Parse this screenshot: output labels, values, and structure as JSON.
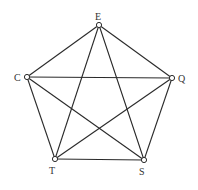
{
  "diagram": {
    "type": "complete-graph",
    "nodes": [
      {
        "id": "E",
        "label": "E",
        "x": 99,
        "y": 25,
        "label_x": 95,
        "label_y": 20
      },
      {
        "id": "C",
        "label": "C",
        "x": 27,
        "y": 77,
        "label_x": 14,
        "label_y": 81
      },
      {
        "id": "Q",
        "label": "Q",
        "x": 172,
        "y": 78,
        "label_x": 178,
        "label_y": 82
      },
      {
        "id": "T",
        "label": "T",
        "x": 55,
        "y": 159,
        "label_x": 49,
        "label_y": 174
      },
      {
        "id": "S",
        "label": "S",
        "x": 144,
        "y": 160,
        "label_x": 139,
        "label_y": 175
      }
    ],
    "edges": [
      [
        "E",
        "C"
      ],
      [
        "E",
        "Q"
      ],
      [
        "E",
        "T"
      ],
      [
        "E",
        "S"
      ],
      [
        "C",
        "Q"
      ],
      [
        "C",
        "T"
      ],
      [
        "C",
        "S"
      ],
      [
        "Q",
        "T"
      ],
      [
        "Q",
        "S"
      ],
      [
        "T",
        "S"
      ]
    ],
    "colors": {
      "edge": "#2a2a2a",
      "node_fill": "#ffffff",
      "node_stroke": "#2a2a2a",
      "label": "#333333",
      "background": "#ffffff"
    },
    "node_radius": 2.6
  }
}
